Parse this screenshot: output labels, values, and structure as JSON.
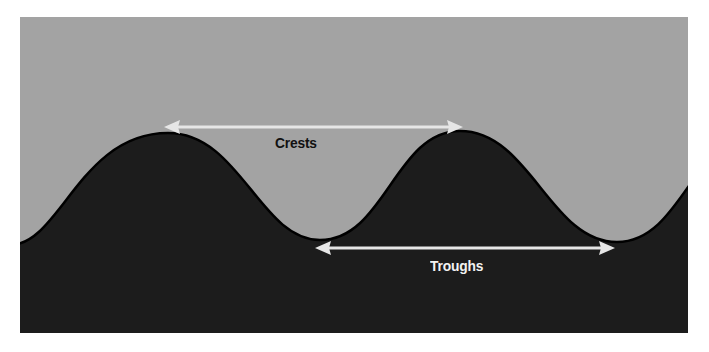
{
  "diagram": {
    "colors": {
      "background": "#ffffff",
      "sky": "#a3a3a3",
      "wave_fill": "#1c1c1c",
      "wave_stroke": "#000000",
      "arrow": "#e6e6e6",
      "crests_text": "#111111",
      "troughs_text": "#f2f2f2"
    },
    "labels": {
      "crests": "Crests",
      "troughs": "Troughs"
    },
    "crest_arrow": {
      "from": [
        165,
        127
      ],
      "to": [
        462,
        127
      ]
    },
    "trough_arrow": {
      "from": [
        316,
        248
      ],
      "to": [
        614,
        248
      ]
    },
    "wave_points": {
      "crests": [
        [
          168,
          133
        ],
        [
          460,
          131
        ]
      ],
      "troughs": [
        [
          320,
          240
        ],
        [
          617,
          242
        ]
      ]
    }
  }
}
